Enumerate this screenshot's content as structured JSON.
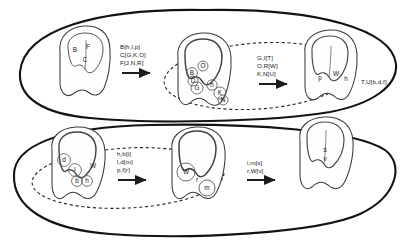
{
  "figure": {
    "type": "diagram",
    "background": "#ffffff",
    "ink": "#2b2b2b",
    "stroke_outer": "#111111"
  },
  "groups": [
    {
      "name": "upper-group-outline",
      "shape": "ellipse-arc",
      "style": "solid-thick"
    },
    {
      "name": "lower-group-outline",
      "shape": "ellipse-arc",
      "style": "solid-thick"
    },
    {
      "name": "upper-dashed-lineage",
      "shape": "ellipse",
      "style": "dashed"
    },
    {
      "name": "lower-dashed-lineage",
      "shape": "ellipse",
      "style": "dashed"
    }
  ],
  "stages": {
    "top_row": [
      {
        "id": "stage-1",
        "name": "tooth-stage-1",
        "cusp_labels": [
          {
            "text": "B",
            "x": 75,
            "y": 52
          },
          {
            "text": "F",
            "x": 88,
            "y": 49
          },
          {
            "text": "C",
            "x": 84,
            "y": 62
          }
        ]
      },
      {
        "id": "stage-2",
        "name": "tooth-stage-2",
        "cusp_labels": [
          {
            "text": "B",
            "x": 191,
            "y": 73
          },
          {
            "text": "O",
            "x": 202,
            "y": 66
          },
          {
            "text": "D",
            "x": 192,
            "y": 81
          },
          {
            "text": "G",
            "x": 196,
            "y": 88
          },
          {
            "text": "h",
            "x": 211,
            "y": 84
          },
          {
            "text": "K",
            "x": 219,
            "y": 92
          },
          {
            "text": "N",
            "x": 222,
            "y": 99
          }
        ]
      },
      {
        "id": "stage-3",
        "name": "tooth-stage-3",
        "cusp_labels": [
          {
            "text": "p",
            "x": 320,
            "y": 78
          },
          {
            "text": "W",
            "x": 335,
            "y": 74
          },
          {
            "text": "h",
            "x": 344,
            "y": 79
          }
        ]
      }
    ],
    "bottom_row": [
      {
        "id": "stage-4",
        "name": "tooth-stage-4",
        "cusp_labels": [
          {
            "text": "d",
            "x": 64,
            "y": 159
          },
          {
            "text": "l",
            "x": 74,
            "y": 169
          },
          {
            "text": "W",
            "x": 92,
            "y": 166
          },
          {
            "text": "b",
            "x": 76,
            "y": 181
          },
          {
            "text": "h",
            "x": 86,
            "y": 180
          }
        ]
      },
      {
        "id": "stage-5",
        "name": "tooth-stage-5",
        "cusp_labels": [
          {
            "text": "W",
            "x": 185,
            "y": 172
          },
          {
            "text": "r",
            "x": 196,
            "y": 180
          },
          {
            "text": "m",
            "x": 208,
            "y": 188
          }
        ]
      },
      {
        "id": "stage-6",
        "name": "tooth-stage-6",
        "cusp_labels": [
          {
            "text": "s",
            "x": 325,
            "y": 150
          },
          {
            "text": "v",
            "x": 325,
            "y": 159
          }
        ]
      }
    ]
  },
  "transitions": [
    {
      "name": "transition-1",
      "lines": [
        "B[h,l,p]",
        "C[G,K,O]",
        "F[J,N,R]"
      ],
      "arrow": "right"
    },
    {
      "name": "transition-2",
      "lines": [
        "G,I[T]",
        "O,R[W]",
        "K,N[U]"
      ],
      "arrow": "right"
    },
    {
      "name": "transition-3",
      "lines": [
        "T,U[b,d,f]"
      ],
      "arrow": "none"
    },
    {
      "name": "transition-4",
      "lines": [
        "h,b[i]",
        "l,d[m]",
        "p,f[r]"
      ],
      "arrow": "right"
    },
    {
      "name": "transition-5",
      "lines": [
        "i,m[s]",
        "r,W[v]"
      ],
      "arrow": "right"
    }
  ]
}
